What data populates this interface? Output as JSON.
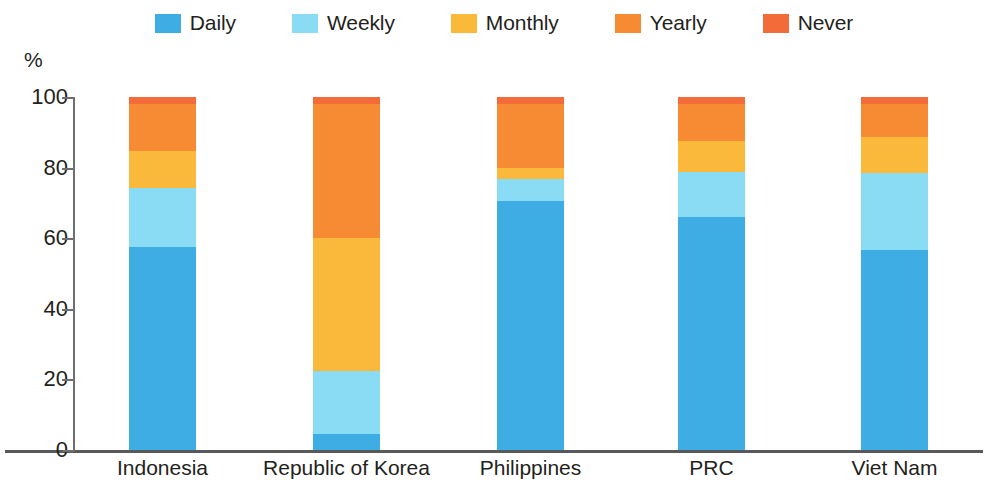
{
  "legend": {
    "items": [
      {
        "label": "Daily",
        "color": "#3eade4",
        "name": "daily"
      },
      {
        "label": "Weekly",
        "color": "#8adcf4",
        "name": "weekly"
      },
      {
        "label": "Monthly",
        "color": "#fbb93b",
        "name": "monthly"
      },
      {
        "label": "Yearly",
        "color": "#f68b33",
        "name": "yearly"
      },
      {
        "label": "Never",
        "color": "#f26b38",
        "name": "never"
      }
    ]
  },
  "axis": {
    "y_unit": "%",
    "y_ticks": [
      "100",
      "80",
      "60",
      "40",
      "20",
      "0"
    ],
    "y_min": 0,
    "y_max": 100
  },
  "chart_data": {
    "type": "bar",
    "subtype": "stacked-percentage",
    "title": "",
    "subtitle": "",
    "xlabel": "",
    "ylabel": "%",
    "ylim": [
      0,
      100
    ],
    "grid": false,
    "legend_position": "top-center",
    "categories": [
      "Indonesia",
      "Republic of Korea",
      "Philippines",
      "PRC",
      "Viet Nam"
    ],
    "series": [
      {
        "name": "Daily",
        "color": "#3eade4",
        "values": [
          57.4,
          4.5,
          70.6,
          65.9,
          56.7
        ]
      },
      {
        "name": "Weekly",
        "color": "#8adcf4",
        "values": [
          16.9,
          18.0,
          6.1,
          12.8,
          21.7
        ]
      },
      {
        "name": "Monthly",
        "color": "#fbb93b",
        "values": [
          10.4,
          37.5,
          3.2,
          8.9,
          10.4
        ]
      },
      {
        "name": "Yearly",
        "color": "#f68b33",
        "values": [
          13.3,
          38.0,
          18.1,
          10.4,
          9.3
        ]
      },
      {
        "name": "Never",
        "color": "#f26b38",
        "values": [
          2.0,
          2.0,
          2.0,
          2.0,
          1.9
        ]
      }
    ]
  },
  "bars": [
    {
      "category": "Indonesia",
      "segments": [
        {
          "series": "Daily",
          "value": 57.4,
          "color": "#3eade4"
        },
        {
          "series": "Weekly",
          "value": 16.9,
          "color": "#8adcf4"
        },
        {
          "series": "Monthly",
          "value": 10.4,
          "color": "#fbb93b"
        },
        {
          "series": "Yearly",
          "value": 13.3,
          "color": "#f68b33"
        },
        {
          "series": "Never",
          "value": 2.0,
          "color": "#f26b38"
        }
      ]
    },
    {
      "category": "Republic of Korea",
      "segments": [
        {
          "series": "Daily",
          "value": 4.5,
          "color": "#3eade4"
        },
        {
          "series": "Weekly",
          "value": 18.0,
          "color": "#8adcf4"
        },
        {
          "series": "Monthly",
          "value": 37.5,
          "color": "#fbb93b"
        },
        {
          "series": "Yearly",
          "value": 38.0,
          "color": "#f68b33"
        },
        {
          "series": "Never",
          "value": 2.0,
          "color": "#f26b38"
        }
      ]
    },
    {
      "category": "Philippines",
      "segments": [
        {
          "series": "Daily",
          "value": 70.6,
          "color": "#3eade4"
        },
        {
          "series": "Weekly",
          "value": 6.1,
          "color": "#8adcf4"
        },
        {
          "series": "Monthly",
          "value": 3.2,
          "color": "#fbb93b"
        },
        {
          "series": "Yearly",
          "value": 18.1,
          "color": "#f68b33"
        },
        {
          "series": "Never",
          "value": 2.0,
          "color": "#f26b38"
        }
      ]
    },
    {
      "category": "PRC",
      "segments": [
        {
          "series": "Daily",
          "value": 65.9,
          "color": "#3eade4"
        },
        {
          "series": "Weekly",
          "value": 12.8,
          "color": "#8adcf4"
        },
        {
          "series": "Monthly",
          "value": 8.9,
          "color": "#fbb93b"
        },
        {
          "series": "Yearly",
          "value": 10.4,
          "color": "#f68b33"
        },
        {
          "series": "Never",
          "value": 2.0,
          "color": "#f26b38"
        }
      ]
    },
    {
      "category": "Viet Nam",
      "segments": [
        {
          "series": "Daily",
          "value": 56.7,
          "color": "#3eade4"
        },
        {
          "series": "Weekly",
          "value": 21.7,
          "color": "#8adcf4"
        },
        {
          "series": "Monthly",
          "value": 10.4,
          "color": "#fbb93b"
        },
        {
          "series": "Yearly",
          "value": 9.3,
          "color": "#f68b33"
        },
        {
          "series": "Never",
          "value": 1.9,
          "color": "#f26b38"
        }
      ]
    }
  ]
}
